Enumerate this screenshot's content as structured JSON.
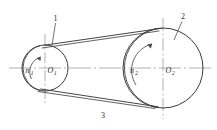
{
  "figure": {
    "type": "belt-drive-schematic",
    "background_color": "#ffffff",
    "line_color": "#3a3a3a",
    "centerline_color": "#8a8a8a",
    "text_color": "#2b2b2b"
  },
  "labels": {
    "small_pulley_speed": "n",
    "small_pulley_speed_sub": "1",
    "small_pulley_center": "O",
    "small_pulley_center_sub": "1",
    "large_pulley_speed": "n",
    "large_pulley_speed_sub": "2",
    "large_pulley_center": "O",
    "large_pulley_center_sub": "2",
    "callout_small_pulley": "1",
    "callout_large_pulley": "2",
    "callout_belt": "3"
  },
  "geometry": {
    "small_pulley": {
      "cx": 45,
      "cy": 68,
      "r": 23
    },
    "large_pulley": {
      "cx": 163,
      "cy": 68,
      "r": 40
    },
    "axis": {
      "y": 68,
      "x_start": 9,
      "x_end": 212
    }
  }
}
